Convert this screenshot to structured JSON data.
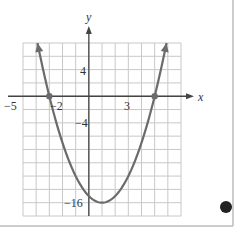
{
  "chart_data": {
    "type": "line",
    "title": "",
    "function": "y = x^2 - 2x - 15",
    "xlabel": "x",
    "ylabel": "y",
    "xlim": [
      -5,
      7
    ],
    "ylim": [
      -18,
      8
    ],
    "grid": true,
    "grid_step_x": 1,
    "grid_step_y": 2,
    "x_tick_labels": [
      {
        "value": -5,
        "label": "−5"
      },
      {
        "value": -2,
        "label": "−2"
      },
      {
        "value": 3,
        "label": "3"
      }
    ],
    "y_tick_labels": [
      {
        "value": 4,
        "label": "4"
      },
      {
        "value": -4,
        "label": "−4"
      },
      {
        "value": -16,
        "label": "−16"
      }
    ],
    "points": [
      {
        "x": -3,
        "y": 0,
        "marked": true
      },
      {
        "x": 5,
        "y": 0,
        "marked": true
      },
      {
        "x": 1,
        "y": -16,
        "marked": false
      }
    ],
    "curve_range": [
      -3.9,
      5.9
    ],
    "colors": {
      "curve": "#6b6b6b",
      "grid": "#c8c8c8",
      "axes": "#444444",
      "frame": "#bdbdbd",
      "dot": "#222222"
    }
  },
  "labels": {
    "x_axis": "x",
    "y_axis": "y",
    "x_neg5": "−5",
    "x_neg2": "−2",
    "x_3": "3",
    "y_4": "4",
    "y_neg4": "−4",
    "y_neg16": "−16"
  }
}
